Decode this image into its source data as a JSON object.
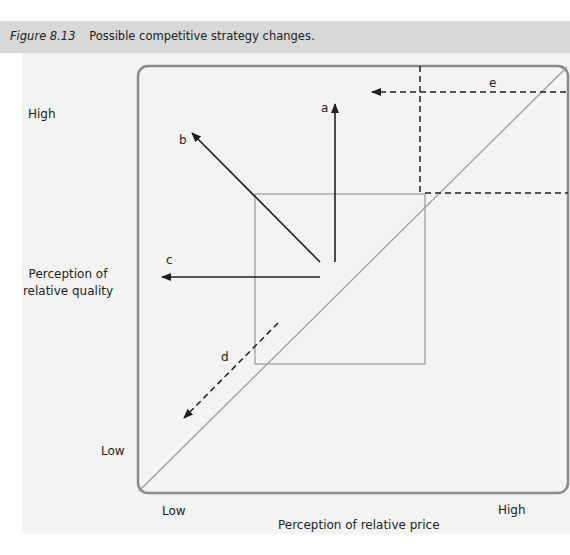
{
  "figure": {
    "number": "Figure 8.13",
    "title": "Possible competitive strategy changes."
  },
  "axes": {
    "y_label_line1": "Perception of",
    "y_label_line2": "relative quality",
    "y_high": "High",
    "y_low": "Low",
    "x_label": "Perception of relative price",
    "x_low": "Low",
    "x_high": "High"
  },
  "arrows": [
    {
      "id": "a",
      "label": "a",
      "style": "solid",
      "direction": "up"
    },
    {
      "id": "b",
      "label": "b",
      "style": "solid",
      "direction": "up-left"
    },
    {
      "id": "c",
      "label": "c",
      "style": "solid",
      "direction": "left"
    },
    {
      "id": "d",
      "label": "d",
      "style": "dashed",
      "direction": "down-left"
    },
    {
      "id": "e",
      "label": "e",
      "style": "dashed",
      "direction": "left"
    }
  ],
  "colors": {
    "frame": "#8a8a8a",
    "arrow": "#231f20",
    "guide": "#9a9a9a",
    "caption_bg": "#d8d8d8"
  }
}
